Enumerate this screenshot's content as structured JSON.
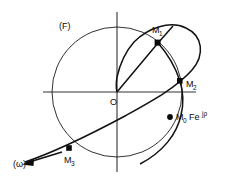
{
  "figure": {
    "background_color": "#ffffff",
    "ink_color": "#111111",
    "labels": {
      "field_label": "(F)",
      "omega_label": "(ω)",
      "origin_label": "O",
      "m1_label": "M",
      "m1_sub": "1",
      "m2_label": "M",
      "m2_sub": "2",
      "m3_label": "M",
      "m3_sub": "3",
      "m0_label": "M",
      "m0_sub": "0",
      "m0_expr": "Fe",
      "m0_exp": "jρ"
    },
    "geometry": {
      "origin": {
        "x": 117,
        "y": 92
      },
      "circle": {
        "cx": 117,
        "cy": 92,
        "r": 65
      },
      "axis_h": {
        "x1": 43,
        "y1": 92,
        "x2": 196,
        "y2": 92
      },
      "axis_v": {
        "x1": 117,
        "y1": 12,
        "x2": 117,
        "y2": 172
      },
      "points": {
        "M1": {
          "x": 158,
          "y": 43
        },
        "M2": {
          "x": 180,
          "y": 81
        },
        "M3": {
          "x": 69,
          "y": 148
        },
        "M0": {
          "x": 170,
          "y": 117
        }
      },
      "arrow_tip": {
        "x": 22,
        "y": 164
      }
    }
  }
}
